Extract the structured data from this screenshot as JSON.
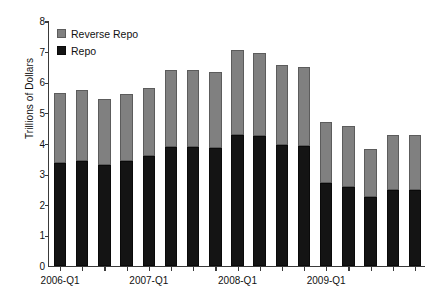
{
  "chart_data": {
    "type": "bar",
    "stacked": true,
    "title": "",
    "xlabel": "",
    "ylabel": "Trillions of Dollars",
    "ylim": [
      0,
      8
    ],
    "yticks": [
      0,
      1,
      2,
      3,
      4,
      5,
      6,
      7,
      8
    ],
    "ytick_labels": [
      "0",
      "1",
      "2",
      "3",
      "4",
      "5",
      "6",
      "7",
      "8"
    ],
    "grid": false,
    "legend_position": "top-left",
    "categories": [
      "2006-Q1",
      "2006-Q2",
      "2006-Q3",
      "2006-Q4",
      "2007-Q1",
      "2007-Q2",
      "2007-Q3",
      "2007-Q4",
      "2008-Q1",
      "2008-Q2",
      "2008-Q3",
      "2008-Q4",
      "2009-Q1",
      "2009-Q2",
      "2009-Q3",
      "2009-Q4",
      "2010-Q1"
    ],
    "xtick_labels": [
      "2006-Q1",
      "2007-Q1",
      "2008-Q1",
      "2009-Q1"
    ],
    "xtick_indices": [
      0,
      4,
      8,
      12
    ],
    "series": [
      {
        "name": "Repo",
        "color": "#141414",
        "values": [
          3.38,
          3.42,
          3.31,
          3.44,
          3.58,
          3.87,
          3.87,
          3.84,
          4.27,
          4.23,
          3.95,
          3.92,
          2.72,
          2.58,
          2.25,
          2.48,
          2.48
        ]
      },
      {
        "name": "Reverse Repo",
        "color": "#808080",
        "values": [
          2.28,
          2.32,
          2.13,
          2.17,
          2.22,
          2.52,
          2.53,
          2.51,
          2.79,
          2.74,
          2.6,
          2.59,
          1.97,
          2.0,
          1.56,
          1.8,
          1.8
        ]
      }
    ],
    "totals": [
      5.66,
      5.74,
      5.44,
      5.61,
      5.8,
      6.39,
      6.4,
      6.35,
      7.06,
      6.97,
      6.55,
      6.51,
      4.69,
      4.58,
      3.81,
      4.28,
      4.28
    ]
  },
  "legend": {
    "items": [
      {
        "label": "Reverse Repo",
        "swatch": "reverse-repo-swatch"
      },
      {
        "label": "Repo",
        "swatch": "repo-swatch"
      }
    ]
  }
}
